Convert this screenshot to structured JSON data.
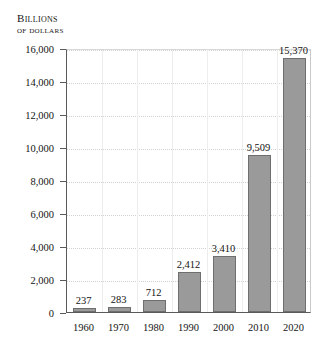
{
  "chart_data": {
    "type": "bar",
    "title": "",
    "subtitle": "",
    "ylabel_line1": "Billions",
    "ylabel_line2": "of dollars",
    "xlabel": "",
    "categories": [
      "1960",
      "1970",
      "1980",
      "1990",
      "2000",
      "2010",
      "2020"
    ],
    "values": [
      237,
      283,
      712,
      2412,
      3410,
      9509,
      15370
    ],
    "value_labels": [
      "237",
      "283",
      "712",
      "2,412",
      "3,410",
      "9,509",
      "15,370"
    ],
    "ylim": [
      0,
      16000
    ],
    "yticks": [
      0,
      2000,
      4000,
      6000,
      8000,
      10000,
      12000,
      14000,
      16000
    ],
    "ytick_labels": [
      "0",
      "2,000",
      "4,000",
      "6,000",
      "8,000",
      "10,000",
      "12,000",
      "14,000",
      "16,000"
    ],
    "grid": "both",
    "legend": "none",
    "bar_color": "#9a9a9a",
    "bar_border_color": "#6e6e6e",
    "grid_color": "#d2d2d2",
    "axis_color": "#5a5a5a",
    "text_color": "#141414",
    "background": "#ffffff"
  }
}
